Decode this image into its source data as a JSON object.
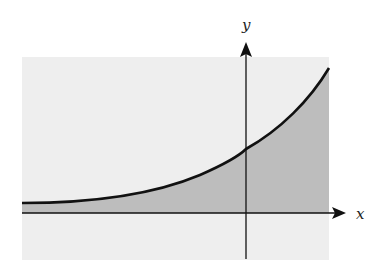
{
  "figure": {
    "title": "",
    "axes": {
      "x_label": "x",
      "y_label": "y"
    },
    "colors": {
      "background_region": "#eeeeee",
      "shaded_region": "#bdbdbd",
      "curve": "#111111",
      "axes": "#111111"
    },
    "curve": {
      "type": "exponential",
      "behavior": "approaches x-axis asymptotically as x → -∞, increases rapidly for x > 0"
    }
  }
}
